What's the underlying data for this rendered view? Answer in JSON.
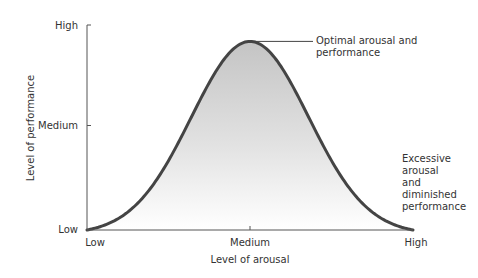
{
  "chart_data": {
    "type": "area",
    "title": "",
    "xlabel": "Level of arousal",
    "ylabel": "Level of performance",
    "x_ticks": [
      "Low",
      "Medium",
      "High"
    ],
    "y_ticks": [
      "Low",
      "Medium",
      "High"
    ],
    "xlim": [
      0,
      2
    ],
    "ylim": [
      0,
      2
    ],
    "grid": false,
    "series": [
      {
        "name": "Performance",
        "shape": "inverted-U (bell curve)",
        "x": [
          0,
          0.25,
          0.5,
          0.75,
          1.0,
          1.25,
          1.5,
          1.75,
          2.0
        ],
        "y": [
          0,
          0.15,
          0.65,
          1.4,
          1.84,
          1.4,
          0.65,
          0.15,
          0
        ]
      }
    ],
    "annotations": [
      {
        "text_lines": [
          "Optimal arousal and",
          "performance"
        ],
        "points_to": "peak",
        "x": 1.0,
        "y": 1.84
      },
      {
        "text_lines": [
          "Excessive",
          "arousal",
          "and",
          "diminished",
          "performance"
        ],
        "points_to": "right tail",
        "x": 2.0,
        "y": 0
      }
    ],
    "colors": {
      "curve": "#444444",
      "fill_top": "#c4c4c4",
      "fill_bottom": "#ffffff",
      "axis": "#555555"
    }
  }
}
